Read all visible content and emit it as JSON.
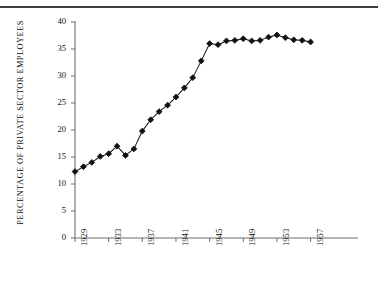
{
  "chart_data": {
    "type": "line",
    "title": "",
    "xlabel": "",
    "ylabel": "PERCENTAGE OF PRIVATE SECTOR EMPLOYEES",
    "xlim": [
      1929,
      1958
    ],
    "ylim": [
      0,
      40
    ],
    "grid": false,
    "legend": null,
    "marker": "diamond",
    "line_color": "#1a1a1a",
    "marker_color": "#111111",
    "axis_color": "#6f6f6f",
    "y_ticks": [
      0,
      5,
      10,
      15,
      20,
      25,
      30,
      35,
      40
    ],
    "y_tick_labels": [
      "0",
      "5",
      "10",
      "15",
      "20",
      "25",
      "30",
      "35",
      "40"
    ],
    "x_ticks": [
      1929,
      1933,
      1937,
      1941,
      1945,
      1949,
      1953,
      1957
    ],
    "x_tick_labels": [
      "1929",
      "1933",
      "1937",
      "1941",
      "1945",
      "1949",
      "1953",
      "1957"
    ],
    "x": [
      1929,
      1930,
      1931,
      1932,
      1933,
      1934,
      1935,
      1936,
      1937,
      1938,
      1939,
      1940,
      1941,
      1942,
      1943,
      1944,
      1945,
      1946,
      1947,
      1948,
      1949,
      1950,
      1951,
      1952,
      1953,
      1954,
      1955,
      1956,
      1957
    ],
    "values": [
      12.3,
      13.2,
      14.0,
      15.1,
      15.6,
      17.0,
      15.3,
      16.5,
      19.8,
      21.9,
      23.4,
      24.6,
      26.1,
      27.8,
      29.7,
      32.8,
      36.0,
      35.8,
      36.5,
      36.6,
      36.9,
      36.5,
      36.6,
      37.2,
      37.6,
      37.1,
      36.7,
      36.6,
      36.3
    ]
  },
  "figure": {
    "top_rule": "horizontal-rule"
  }
}
